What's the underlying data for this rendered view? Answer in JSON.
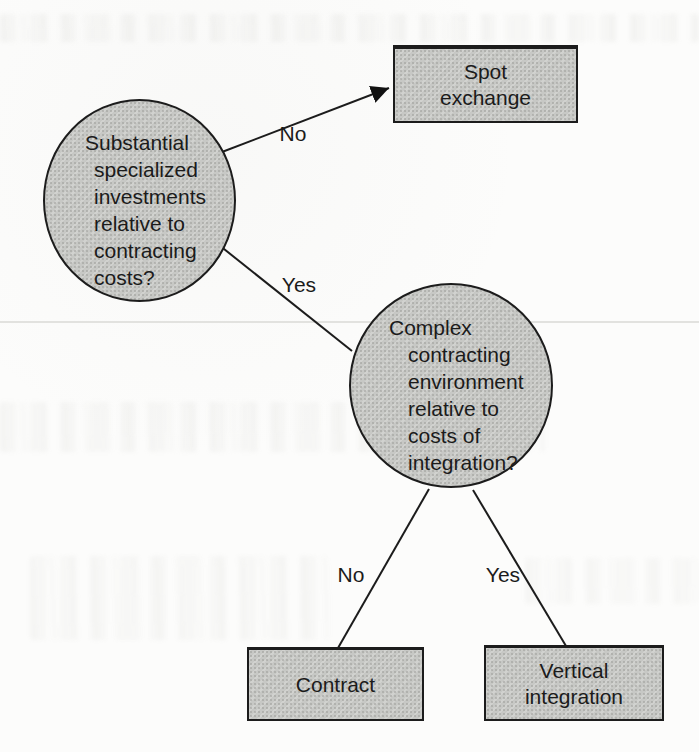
{
  "theme": {
    "page_bg": "#fcfcfb",
    "node_fill": "#c7c8c5",
    "node_border": "#1c1c1c",
    "connector": "#1c1c1c",
    "text": "#1b1b1b",
    "rule_line": "#e2e2df"
  },
  "diagram": {
    "type": "decision-tree",
    "nodes": [
      {
        "id": "decision-specialized-investments",
        "shape": "circle",
        "text": "Substantial\nspecialized\ninvestments\nrelative to\ncontracting\ncosts?"
      },
      {
        "id": "outcome-spot-exchange",
        "shape": "rect",
        "text": "Spot\nexchange"
      },
      {
        "id": "decision-contracting-environment",
        "shape": "circle",
        "text": "Complex\ncontracting\nenvironment\nrelative to\ncosts of\nintegration?"
      },
      {
        "id": "outcome-contract",
        "shape": "rect",
        "text": "Contract"
      },
      {
        "id": "outcome-vertical-integration",
        "shape": "rect",
        "text": "Vertical\nintegration"
      }
    ],
    "edges": [
      {
        "from": "decision-specialized-investments",
        "to": "outcome-spot-exchange",
        "label": "No",
        "arrowhead": true
      },
      {
        "from": "decision-specialized-investments",
        "to": "decision-contracting-environment",
        "label": "Yes",
        "arrowhead": false
      },
      {
        "from": "decision-contracting-environment",
        "to": "outcome-contract",
        "label": "No",
        "arrowhead": false
      },
      {
        "from": "decision-contracting-environment",
        "to": "outcome-vertical-integration",
        "label": "Yes",
        "arrowhead": false
      }
    ]
  }
}
